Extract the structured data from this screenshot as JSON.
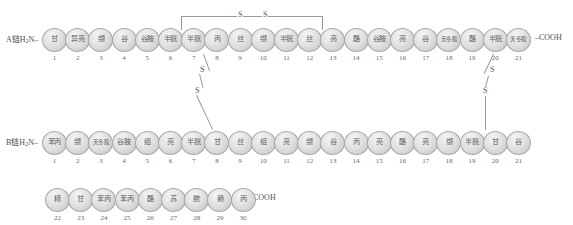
{
  "diagram": {
    "chains": [
      {
        "id": "A",
        "label": "A链H",
        "label_sub": "2",
        "label_tail": "N",
        "n_terminus": "A链H2N",
        "c_terminus": "COOH",
        "residues": [
          {
            "n": 1,
            "name": "甘"
          },
          {
            "n": 2,
            "name": "异亮"
          },
          {
            "n": 3,
            "name": "缬"
          },
          {
            "n": 4,
            "name": "谷"
          },
          {
            "n": 5,
            "name": "谷胺"
          },
          {
            "n": 6,
            "name": "半胱"
          },
          {
            "n": 7,
            "name": "半胱"
          },
          {
            "n": 8,
            "name": "丙"
          },
          {
            "n": 9,
            "name": "丝"
          },
          {
            "n": 10,
            "name": "缬"
          },
          {
            "n": 11,
            "name": "半胱"
          },
          {
            "n": 12,
            "name": "丝"
          },
          {
            "n": 13,
            "name": "亮"
          },
          {
            "n": 14,
            "name": "酪"
          },
          {
            "n": 15,
            "name": "谷胺"
          },
          {
            "n": 16,
            "name": "亮"
          },
          {
            "n": 17,
            "name": "谷"
          },
          {
            "n": 18,
            "name": "天冬胺"
          },
          {
            "n": 19,
            "name": "酪"
          },
          {
            "n": 20,
            "name": "半胱"
          },
          {
            "n": 21,
            "name": "天冬胺"
          }
        ]
      },
      {
        "id": "B",
        "label": "B链H",
        "label_sub": "2",
        "label_tail": "N",
        "n_terminus": "B链H2N",
        "c_terminus": "COOH",
        "residues": [
          {
            "n": 1,
            "name": "苯丙"
          },
          {
            "n": 2,
            "name": "缬"
          },
          {
            "n": 3,
            "name": "天冬胺"
          },
          {
            "n": 4,
            "name": "谷胺"
          },
          {
            "n": 5,
            "name": "组"
          },
          {
            "n": 6,
            "name": "亮"
          },
          {
            "n": 7,
            "name": "半胱"
          },
          {
            "n": 8,
            "name": "甘"
          },
          {
            "n": 9,
            "name": "丝"
          },
          {
            "n": 10,
            "name": "组"
          },
          {
            "n": 11,
            "name": "亮"
          },
          {
            "n": 12,
            "name": "缬"
          },
          {
            "n": 13,
            "name": "谷"
          },
          {
            "n": 14,
            "name": "丙"
          },
          {
            "n": 15,
            "name": "亮"
          },
          {
            "n": 16,
            "name": "酪"
          },
          {
            "n": 17,
            "name": "亮"
          },
          {
            "n": 18,
            "name": "缬"
          },
          {
            "n": 19,
            "name": "半胱"
          },
          {
            "n": 20,
            "name": "甘"
          },
          {
            "n": 21,
            "name": "谷"
          },
          {
            "n": 22,
            "name": "精"
          },
          {
            "n": 23,
            "name": "甘"
          },
          {
            "n": 24,
            "name": "苯丙"
          },
          {
            "n": 25,
            "name": "苯丙"
          },
          {
            "n": 26,
            "name": "酪"
          },
          {
            "n": 27,
            "name": "苏"
          },
          {
            "n": 28,
            "name": "脓"
          },
          {
            "n": 29,
            "name": "赖"
          },
          {
            "n": 30,
            "name": "丙"
          }
        ]
      }
    ],
    "disulfide_bonds": [
      {
        "id": "A6-A11",
        "label_1": "S",
        "label_2": "S",
        "type": "intrachain"
      },
      {
        "id": "A7-B7",
        "label_1": "S",
        "label_2": "S",
        "type": "interchain"
      },
      {
        "id": "A20-B19",
        "label_1": "S",
        "label_2": "S",
        "type": "interchain"
      }
    ],
    "colors": {
      "oval_fill": "#dcdcdc",
      "oval_stroke": "#a8a8a8",
      "text": "#5d5d5d",
      "bond_line": "#9a9a9a",
      "background": "#ffffff"
    }
  }
}
